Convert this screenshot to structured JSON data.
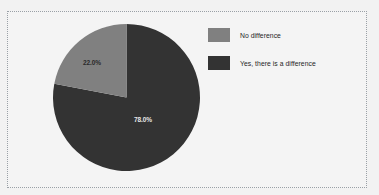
{
  "chart_data": {
    "type": "pie",
    "title": "",
    "categories": [
      "No difference",
      "Yes, there is a difference"
    ],
    "values": [
      22.0,
      78.0
    ],
    "labels": [
      "22.0%",
      "78.0%"
    ],
    "colors": [
      "#808080",
      "#333333"
    ],
    "legend_position": "right",
    "grid": false,
    "start_angle_deg": 90,
    "direction": "counterclockwise",
    "xlabel": "",
    "ylabel": ""
  },
  "legend": {
    "items": [
      {
        "label": "No difference",
        "color": "#808080"
      },
      {
        "label": "Yes, there is a difference",
        "color": "#333333"
      }
    ]
  },
  "pie": {
    "slice_gray_label": "22.0%",
    "slice_dark_label": "78.0%"
  },
  "colors": {
    "background": "#f2f2f2",
    "panel": "#f4f4f4",
    "border": "#9aa0a6",
    "gray_slice": "#808080",
    "dark_slice": "#333333",
    "text": "#1f1f1f"
  }
}
